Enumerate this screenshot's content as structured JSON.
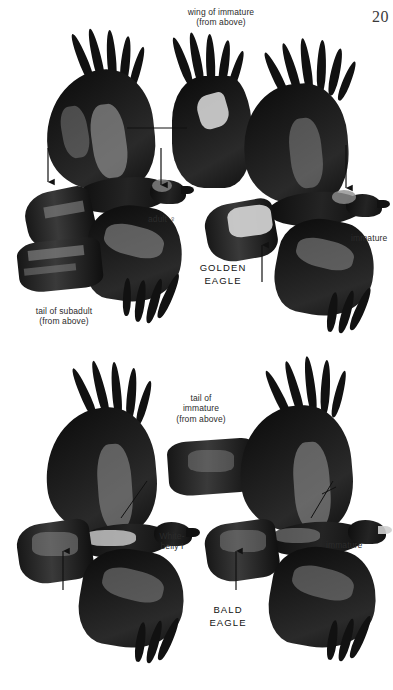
{
  "page": {
    "folio": "20",
    "background_color": "#ffffff",
    "ink_color": "#111111"
  },
  "plate": {
    "title_top_species": "GOLDEN\nEAGLE",
    "title_bottom_species": "BALD\nEAGLE"
  },
  "labels": {
    "wing_of_immature": "wing of immature\n(from above)",
    "adult_female": "adult ♀",
    "golden_eagle": "GOLDEN\nEAGLE",
    "immature_top": "immature",
    "tail_of_subadult": "tail of subadult\n(from above)",
    "tail_of_immature": "tail of\nimmature\n(from above)",
    "white_belly_one": "White-\nbelly I",
    "bald_eagle": "BALD\nEAGLE",
    "immature_bottom": "immature"
  },
  "figures": [
    {
      "id": "golden-eagle-adult-female",
      "species": "Golden Eagle",
      "plumage": "adult female",
      "view": "from above, in flight",
      "panel": "top",
      "position": "left"
    },
    {
      "id": "golden-eagle-immature-wing",
      "species": "Golden Eagle",
      "plumage": "immature",
      "view": "wing from above",
      "panel": "top",
      "position": "center"
    },
    {
      "id": "golden-eagle-immature",
      "species": "Golden Eagle",
      "plumage": "immature",
      "view": "from above, in flight",
      "panel": "top",
      "position": "right"
    },
    {
      "id": "golden-eagle-subadult-tail",
      "species": "Golden Eagle",
      "plumage": "subadult",
      "view": "tail from above",
      "panel": "top",
      "position": "lower-left"
    },
    {
      "id": "bald-eagle-white-belly-one",
      "species": "Bald Eagle",
      "plumage": "White-belly I",
      "view": "from above, in flight",
      "panel": "bottom",
      "position": "left"
    },
    {
      "id": "bald-eagle-immature-tail",
      "species": "Bald Eagle",
      "plumage": "immature",
      "view": "tail from above",
      "panel": "bottom",
      "position": "center"
    },
    {
      "id": "bald-eagle-immature",
      "species": "Bald Eagle",
      "plumage": "immature",
      "view": "from above, in flight",
      "panel": "bottom",
      "position": "right"
    }
  ],
  "annotations": [
    {
      "id": "a1",
      "kind": "arrow",
      "direction": "down",
      "panel": "top",
      "target": "golden eagle adult upperwing covert bar"
    },
    {
      "id": "a2",
      "kind": "arrow",
      "direction": "down",
      "panel": "top",
      "target": "golden eagle adult nape / golden hackles"
    },
    {
      "id": "a3",
      "kind": "leader",
      "direction": "horizontal",
      "panel": "top",
      "target": "golden eagle adult upperwing panel"
    },
    {
      "id": "a4",
      "kind": "arrow",
      "direction": "up",
      "panel": "top",
      "target": "golden eagle immature white tail base"
    },
    {
      "id": "a5",
      "kind": "arrow",
      "direction": "down",
      "panel": "top",
      "target": "golden eagle immature nape"
    },
    {
      "id": "a6",
      "kind": "arrow",
      "direction": "up",
      "panel": "bottom",
      "target": "bald eagle white-belly I tail"
    },
    {
      "id": "a7",
      "kind": "arrow",
      "direction": "up",
      "panel": "bottom",
      "target": "bald eagle immature tail"
    },
    {
      "id": "a8",
      "kind": "leader",
      "direction": "diagonal",
      "panel": "bottom",
      "target": "bald eagle white-belly I upperwing"
    },
    {
      "id": "a9",
      "kind": "leader",
      "direction": "diagonal",
      "panel": "bottom",
      "target": "bald eagle immature upperwing"
    }
  ]
}
